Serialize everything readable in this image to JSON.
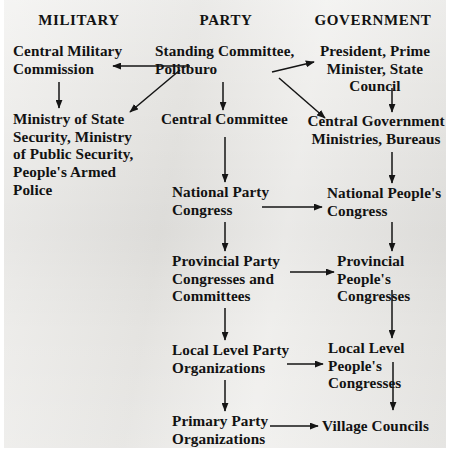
{
  "diagram": {
    "title_row": {
      "columns": [
        {
          "id": "military",
          "label": "MILITARY"
        },
        {
          "id": "party",
          "label": "PARTY"
        },
        {
          "id": "government",
          "label": "GOVERNMENT"
        }
      ]
    },
    "colors": {
      "page_background": "#ffffff",
      "scan_background": "#e9e8e5",
      "ink": "#121212"
    },
    "nodes": [
      {
        "id": "central-military-commission",
        "column": "military",
        "label": "Central Military\nCommission"
      },
      {
        "id": "ministry-state-security",
        "column": "military",
        "label": "Ministry of State\nSecurity, Ministry\nof Public Security,\nPeople's Armed\nPolice"
      },
      {
        "id": "standing-committee-politburo",
        "column": "party",
        "label": "Standing Committee,\nPolitburo"
      },
      {
        "id": "central-committee",
        "column": "party",
        "label": "Central Committee"
      },
      {
        "id": "national-party-congress",
        "column": "party",
        "label": "National Party\nCongress"
      },
      {
        "id": "provincial-party-congresses",
        "column": "party",
        "label": "Provincial Party\nCongresses and\nCommittees"
      },
      {
        "id": "local-level-party-organizations",
        "column": "party",
        "label": "Local Level Party\nOrganizations"
      },
      {
        "id": "primary-party-organizations",
        "column": "party",
        "label": "Primary Party\nOrganizations"
      },
      {
        "id": "president-premier-state-council",
        "column": "government",
        "label": "President, Prime\nMinister, State\nCouncil"
      },
      {
        "id": "central-government-ministries",
        "column": "government",
        "label": "Central Government\nMinistries, Bureaus"
      },
      {
        "id": "national-peoples-congress",
        "column": "government",
        "label": "National People's\nCongress"
      },
      {
        "id": "provincial-peoples-congresses",
        "column": "government",
        "label": "Provincial People's\nCongresses"
      },
      {
        "id": "local-level-peoples-congresses",
        "column": "government",
        "label": "Local Level\nPeople's\nCongresses"
      },
      {
        "id": "village-councils",
        "column": "government",
        "label": "Village Councils"
      }
    ],
    "edges": [
      {
        "from": "standing-committee-politburo",
        "to": "central-military-commission",
        "kind": "horizontal-left"
      },
      {
        "from": "standing-committee-politburo",
        "to": "ministry-state-security",
        "kind": "diagonal-down-left"
      },
      {
        "from": "standing-committee-politburo",
        "to": "central-committee",
        "kind": "vertical-down"
      },
      {
        "from": "standing-committee-politburo",
        "to": "president-premier-state-council",
        "kind": "diagonal-up-right"
      },
      {
        "from": "standing-committee-politburo",
        "to": "central-government-ministries",
        "kind": "diagonal-down-right"
      },
      {
        "from": "central-military-commission",
        "to": "ministry-state-security",
        "kind": "vertical-down"
      },
      {
        "from": "central-committee",
        "to": "national-party-congress",
        "kind": "vertical-down"
      },
      {
        "from": "national-party-congress",
        "to": "provincial-party-congresses",
        "kind": "vertical-down"
      },
      {
        "from": "provincial-party-congresses",
        "to": "local-level-party-organizations",
        "kind": "vertical-down"
      },
      {
        "from": "local-level-party-organizations",
        "to": "primary-party-organizations",
        "kind": "vertical-down"
      },
      {
        "from": "president-premier-state-council",
        "to": "central-government-ministries",
        "kind": "vertical-down"
      },
      {
        "from": "central-government-ministries",
        "to": "national-peoples-congress",
        "kind": "vertical-down"
      },
      {
        "from": "national-peoples-congress",
        "to": "provincial-peoples-congresses",
        "kind": "vertical-down"
      },
      {
        "from": "provincial-peoples-congresses",
        "to": "local-level-peoples-congresses",
        "kind": "vertical-down"
      },
      {
        "from": "local-level-peoples-congresses",
        "to": "village-councils",
        "kind": "vertical-down"
      },
      {
        "from": "national-party-congress",
        "to": "national-peoples-congress",
        "kind": "horizontal-right"
      },
      {
        "from": "provincial-party-congresses",
        "to": "provincial-peoples-congresses",
        "kind": "horizontal-right"
      },
      {
        "from": "local-level-party-organizations",
        "to": "local-level-peoples-congresses",
        "kind": "horizontal-right"
      },
      {
        "from": "primary-party-organizations",
        "to": "village-councils",
        "kind": "horizontal-right"
      }
    ]
  }
}
